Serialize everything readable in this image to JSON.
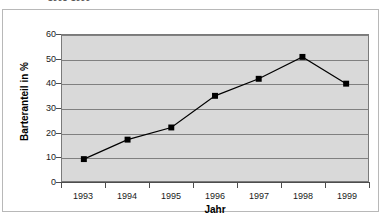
{
  "top_caption": "1993-1999",
  "chart_data": {
    "type": "line",
    "title": "",
    "xlabel": "Jahr",
    "ylabel": "Barteranteil in %",
    "categories": [
      "1993",
      "1994",
      "1995",
      "1996",
      "1997",
      "1998",
      "1999"
    ],
    "values": [
      9,
      17,
      22,
      35,
      42,
      51,
      40
    ],
    "series": [
      {
        "name": "Barteranteil in %",
        "values": [
          9,
          17,
          22,
          35,
          42,
          51,
          40
        ]
      }
    ],
    "ylim": [
      0,
      60
    ],
    "ytick_labels": [
      "60",
      "50",
      "40",
      "30",
      "20",
      "10",
      "0"
    ],
    "ytick_values": [
      60,
      50,
      40,
      30,
      20,
      10,
      0
    ],
    "xtick_labels": [
      "1993",
      "1994",
      "1995",
      "1996",
      "1997",
      "1998",
      "1999"
    ],
    "grid": "horizontal",
    "legend": "none",
    "marker": "square",
    "colors": {
      "line": "#000000",
      "marker": "#000000",
      "plot_background": "#d9d9d9",
      "gridline": "#808080",
      "axis": "#4d4d4d",
      "frame": "#b8b8b8",
      "page_background": "#ffffff",
      "text": "#1a1a1a"
    }
  }
}
